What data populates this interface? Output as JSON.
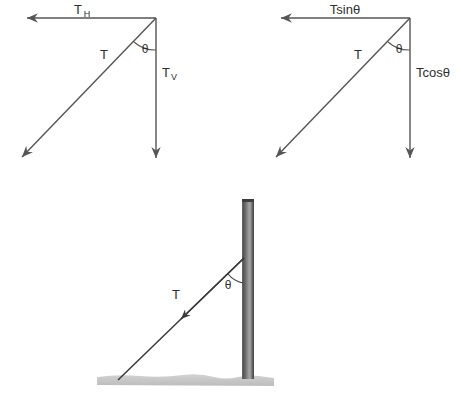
{
  "figure": {
    "background_color": "#ffffff",
    "stroke_color": "#555555",
    "text_color": "#2e2e2e"
  },
  "diagram_one": {
    "name": "Vector decomposition with component labels",
    "horizontal_label": "T",
    "horizontal_subscript": "H",
    "vertical_label": "T",
    "vertical_subscript": "V",
    "resultant_label": "T",
    "angle_label": "θ"
  },
  "diagram_two": {
    "name": "Vector decomposition with trigonometric labels",
    "horizontal_label": "Tsinθ",
    "vertical_label": "Tcosθ",
    "resultant_label": "T",
    "angle_label": "θ"
  },
  "diagram_three": {
    "name": "Pole with guy wire under tension",
    "tension_label": "T",
    "angle_label": "θ",
    "pole_color_light": "#b4b4b4",
    "pole_color_dark": "#4a4a4a",
    "ground_color": "#c9c9c9"
  }
}
